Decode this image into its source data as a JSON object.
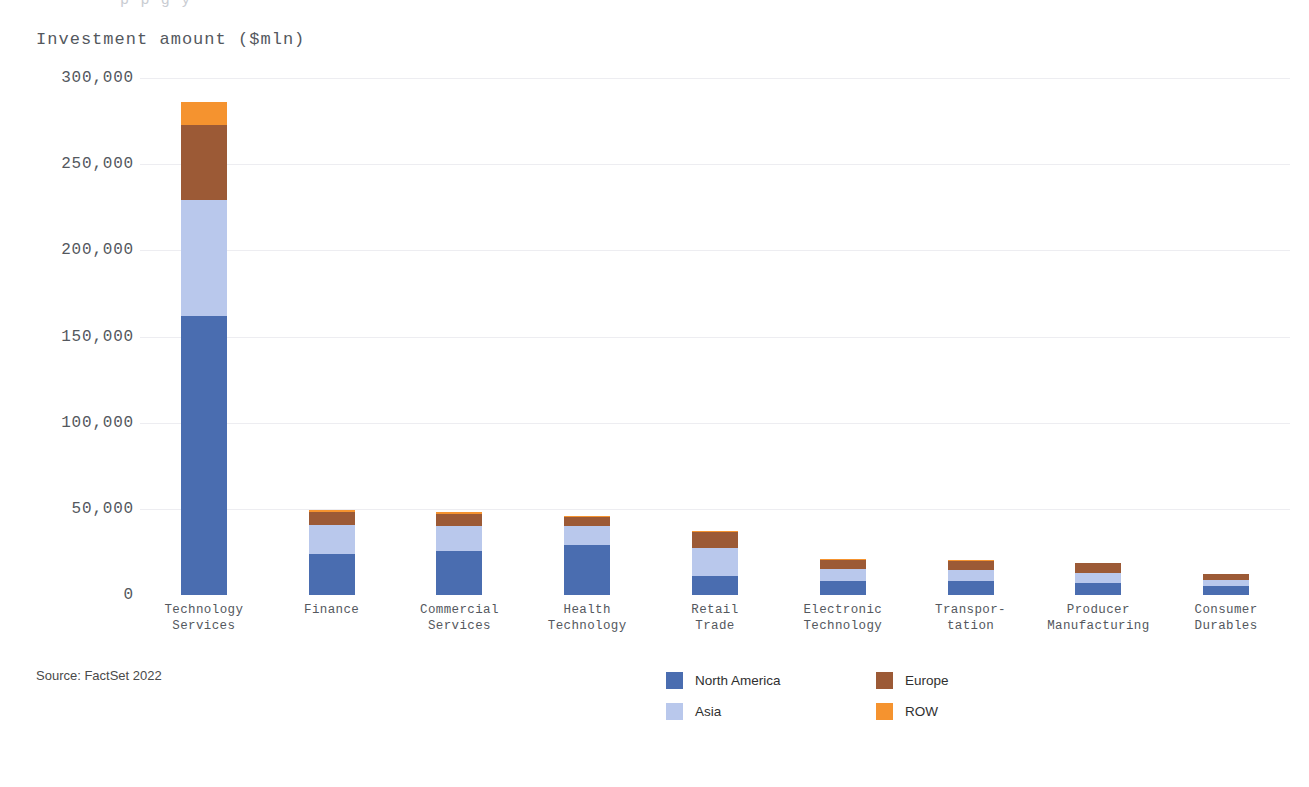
{
  "top_clipped_text": "p           p                g       y",
  "source_note": "Source: FactSet 2022",
  "chart_data": {
    "type": "bar",
    "subtype": "stacked-vertical",
    "title": "Investment amount ($mln)",
    "xlabel": "",
    "ylabel": "Investment amount ($mln)",
    "ylim": [
      0,
      300000
    ],
    "grid": true,
    "legend_position": "bottom-right",
    "yticks": [
      0,
      50000,
      100000,
      150000,
      200000,
      250000,
      300000
    ],
    "ytick_labels": [
      "0",
      "50,000",
      "100,000",
      "150,000",
      "200,000",
      "250,000",
      "300,000"
    ],
    "categories": [
      "Technology\nServices",
      "Finance",
      "Commercial\nServices",
      "Health\nTechnology",
      "Retail\nTrade",
      "Electronic\nTechnology",
      "Transpor-\ntation",
      "Producer\nManufacturing",
      "Consumer\nDurables"
    ],
    "series": [
      {
        "name": "North America",
        "color": "#4a6db0",
        "values": [
          162000,
          24000,
          25500,
          29000,
          11000,
          8000,
          8000,
          7000,
          5500
        ]
      },
      {
        "name": "Asia",
        "color": "#b9c8ec",
        "values": [
          67000,
          16500,
          14500,
          11000,
          16500,
          7000,
          6500,
          6000,
          3500
        ]
      },
      {
        "name": "Europe",
        "color": "#9c5a36",
        "values": [
          44000,
          7500,
          7000,
          5000,
          9000,
          5500,
          5500,
          5500,
          3000
        ]
      },
      {
        "name": "ROW",
        "color": "#f5932f",
        "values": [
          13000,
          1200,
          1200,
          700,
          500,
          400,
          300,
          300,
          200
        ]
      }
    ],
    "totals": [
      286000,
      49200,
      48200,
      45700,
      37000,
      20900,
      20300,
      18800,
      12200
    ]
  },
  "legend": {
    "items": [
      {
        "label": "North America",
        "color": "#4a6db0"
      },
      {
        "label": "Europe",
        "color": "#9c5a36"
      },
      {
        "label": "Asia",
        "color": "#b9c8ec"
      },
      {
        "label": "ROW",
        "color": "#f5932f"
      }
    ]
  },
  "colors": {
    "north_america": "#4a6db0",
    "asia": "#b9c8ec",
    "europe": "#9c5a36",
    "row": "#f5932f",
    "text": "#54585e",
    "grid": "#ededf1",
    "background": "#ffffff"
  }
}
